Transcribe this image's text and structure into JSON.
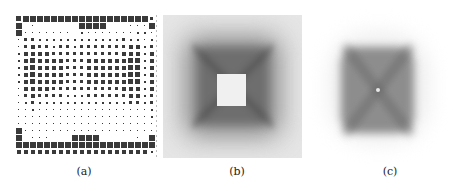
{
  "figure": {
    "panels": [
      {
        "id": "a",
        "label": "(a)",
        "description": "20x20 grid of squares with varying sizes (array layout)"
      },
      {
        "id": "b",
        "label": "(b)",
        "description": "grayscale map with dark square ring around a white center square"
      },
      {
        "id": "c",
        "label": "(c)",
        "description": "grayscale map of a square blob with darker X-shaped diagonals and a light center point"
      }
    ],
    "grid": {
      "rows": 20,
      "cols": 20,
      "pitch": 7,
      "color": "#3a3a3a",
      "sizes": [
        [
          5,
          6,
          6,
          6,
          6,
          6,
          6,
          6,
          6,
          6,
          6,
          6,
          6,
          6,
          6,
          6,
          6,
          6,
          6,
          3
        ],
        [
          6,
          0,
          1,
          0,
          0,
          0,
          0,
          0,
          0,
          6,
          6,
          6,
          6,
          0,
          0,
          0,
          1,
          1,
          1,
          6
        ],
        [
          6,
          1,
          1,
          1,
          1,
          1,
          1,
          1,
          0,
          2,
          1,
          1,
          1,
          1,
          1,
          1,
          1,
          2,
          2,
          1
        ],
        [
          1,
          3,
          3,
          2,
          2,
          2,
          2,
          2,
          2,
          2,
          2,
          2,
          2,
          2,
          2,
          3,
          2,
          2,
          1,
          2
        ],
        [
          1,
          3,
          4,
          3,
          3,
          2,
          3,
          3,
          2,
          3,
          3,
          3,
          3,
          3,
          3,
          3,
          4,
          4,
          2,
          3
        ],
        [
          2,
          4,
          4,
          4,
          4,
          3,
          3,
          3,
          3,
          3,
          3,
          3,
          3,
          3,
          3,
          4,
          4,
          4,
          2,
          4
        ],
        [
          2,
          4,
          5,
          4,
          4,
          4,
          4,
          3,
          3,
          3,
          4,
          4,
          4,
          4,
          4,
          4,
          5,
          5,
          2,
          4
        ],
        [
          2,
          4,
          5,
          4,
          4,
          4,
          4,
          3,
          3,
          3,
          4,
          4,
          4,
          4,
          4,
          4,
          5,
          5,
          2,
          4
        ],
        [
          2,
          4,
          5,
          4,
          4,
          4,
          4,
          3,
          3,
          3,
          4,
          4,
          4,
          4,
          4,
          4,
          5,
          5,
          2,
          4
        ],
        [
          2,
          4,
          5,
          4,
          4,
          4,
          4,
          3,
          3,
          3,
          4,
          4,
          4,
          4,
          4,
          4,
          5,
          5,
          2,
          4
        ],
        [
          1,
          4,
          4,
          4,
          4,
          3,
          3,
          3,
          3,
          3,
          3,
          3,
          3,
          3,
          3,
          4,
          4,
          4,
          2,
          4
        ],
        [
          1,
          3,
          4,
          3,
          3,
          3,
          3,
          2,
          2,
          2,
          3,
          3,
          3,
          3,
          3,
          3,
          4,
          4,
          2,
          3
        ],
        [
          1,
          2,
          3,
          2,
          2,
          2,
          2,
          2,
          2,
          2,
          2,
          2,
          2,
          2,
          2,
          2,
          3,
          3,
          2,
          3
        ],
        [
          1,
          1,
          2,
          1,
          1,
          1,
          1,
          1,
          1,
          1,
          1,
          1,
          1,
          1,
          1,
          1,
          1,
          1,
          1,
          2
        ],
        [
          1,
          1,
          1,
          1,
          1,
          1,
          1,
          1,
          1,
          1,
          1,
          1,
          1,
          1,
          1,
          1,
          1,
          1,
          1,
          2
        ],
        [
          1,
          1,
          1,
          1,
          1,
          1,
          1,
          1,
          1,
          1,
          1,
          1,
          1,
          1,
          1,
          1,
          1,
          1,
          1,
          1
        ],
        [
          6,
          1,
          1,
          1,
          1,
          1,
          1,
          1,
          1,
          1,
          1,
          1,
          1,
          1,
          1,
          1,
          1,
          1,
          1,
          1
        ],
        [
          6,
          0,
          1,
          1,
          1,
          0,
          0,
          0,
          6,
          6,
          6,
          6,
          0,
          0,
          0,
          0,
          0,
          1,
          0,
          6
        ],
        [
          6,
          6,
          6,
          6,
          6,
          6,
          6,
          6,
          6,
          6,
          6,
          6,
          6,
          6,
          6,
          6,
          6,
          6,
          6,
          6
        ],
        [
          4,
          4,
          4,
          4,
          4,
          4,
          4,
          4,
          4,
          4,
          4,
          4,
          4,
          4,
          4,
          4,
          4,
          4,
          4,
          2
        ]
      ]
    }
  }
}
